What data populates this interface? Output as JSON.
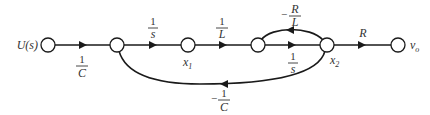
{
  "diagram": {
    "type": "signal-flow-graph",
    "nodes": [
      {
        "id": "U",
        "label": "U(s)"
      },
      {
        "id": "n1",
        "label": ""
      },
      {
        "id": "x1",
        "label": "x",
        "subscript": "1"
      },
      {
        "id": "n3",
        "label": ""
      },
      {
        "id": "x2",
        "label": "x",
        "subscript": "2"
      },
      {
        "id": "vo",
        "label": "v",
        "subscript": "o"
      }
    ],
    "edges": [
      {
        "from": "U",
        "to": "n1",
        "gain": {
          "sign": "",
          "num": "1",
          "den": "C"
        }
      },
      {
        "from": "n1",
        "to": "x1",
        "gain": {
          "sign": "",
          "num": "1",
          "den": "s"
        }
      },
      {
        "from": "x1",
        "to": "n3",
        "gain": {
          "sign": "",
          "num": "1",
          "den": "L"
        }
      },
      {
        "from": "n3",
        "to": "x2",
        "gain": {
          "sign": "",
          "num": "1",
          "den": "s"
        }
      },
      {
        "from": "x2",
        "to": "n3",
        "gain": {
          "sign": "−",
          "num": "R",
          "den": "L"
        }
      },
      {
        "from": "x2",
        "to": "n1",
        "gain": {
          "sign": "−",
          "num": "1",
          "den": "C"
        }
      },
      {
        "from": "x2",
        "to": "vo",
        "gain": {
          "sign": "",
          "plain": "R"
        }
      }
    ]
  }
}
